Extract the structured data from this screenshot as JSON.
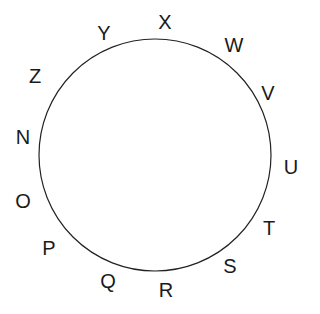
{
  "diagram": {
    "type": "circle-with-labels",
    "title": "",
    "background_color": "#ffffff",
    "circle": {
      "center_x": 155,
      "center_y": 155,
      "radius": 116,
      "stroke_color": "#222222",
      "stroke_width": 1.2,
      "fill": "none"
    },
    "label_color": "#1a1a1a",
    "labels": [
      {
        "text": "X",
        "x": 165,
        "y": 22
      },
      {
        "text": "W",
        "x": 234,
        "y": 45
      },
      {
        "text": "V",
        "x": 268,
        "y": 93
      },
      {
        "text": "U",
        "x": 291,
        "y": 167
      },
      {
        "text": "T",
        "x": 269,
        "y": 228
      },
      {
        "text": "S",
        "x": 230,
        "y": 266
      },
      {
        "text": "R",
        "x": 166,
        "y": 290
      },
      {
        "text": "Q",
        "x": 108,
        "y": 281
      },
      {
        "text": "P",
        "x": 49,
        "y": 248
      },
      {
        "text": "O",
        "x": 23,
        "y": 201
      },
      {
        "text": "N",
        "x": 23,
        "y": 137
      },
      {
        "text": "Z",
        "x": 35,
        "y": 76
      },
      {
        "text": "Y",
        "x": 104,
        "y": 33
      }
    ]
  }
}
